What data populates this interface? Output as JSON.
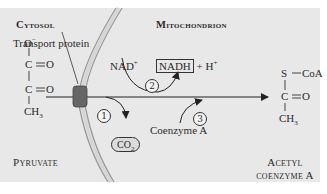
{
  "regions": {
    "cytosol": "Cytosol",
    "mitochondrion": "Mitochondrion"
  },
  "labels": {
    "transport_protein": "Transport protein",
    "nad_plus": "NAD",
    "nad_plus_sup": "+",
    "nadh": "NADH",
    "plus_h": "+ H",
    "plus_h_sup": "+",
    "co2": "CO",
    "co2_sub": "2",
    "coenzyme_a": "Coenzyme A",
    "pyruvate": "Pyruvate",
    "acetyl_line1": "Acetyl",
    "acetyl_line2": "coenzyme A"
  },
  "steps": [
    "1",
    "2",
    "3"
  ],
  "pyruvate_structure": {
    "o_minus": "O",
    "o_minus_sup": "−",
    "c1": "C",
    "o1": "O",
    "c2": "C",
    "o2": "O",
    "ch3": "CH",
    "ch3_sub": "3"
  },
  "acetyl_coa_structure": {
    "s": "S",
    "coa": "CoA",
    "c": "C",
    "o": "O",
    "ch3": "CH",
    "ch3_sub": "3"
  },
  "colors": {
    "panel": "#e8e8e8",
    "membrane": "#9a9a9a",
    "transport_protein": "#666666",
    "ink": "#2a2a2a"
  }
}
